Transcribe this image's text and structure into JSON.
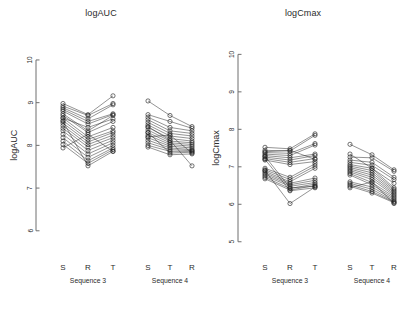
{
  "figure": {
    "width": 404,
    "height": 320,
    "background": "#ffffff",
    "ink": "#1f1f1f",
    "axis_color": "#6f6f6f"
  },
  "panels": [
    {
      "id": "logauc",
      "title": "logAUC",
      "ylabel": "logAUC"
    },
    {
      "id": "logcmax",
      "title": "logCmax",
      "ylabel": "logCmax"
    }
  ],
  "chart_data": [
    {
      "type": "line",
      "title": "logAUC",
      "xlabel": "",
      "ylabel": "logAUC",
      "ylim": [
        5.55,
        10.35
      ],
      "yticks": [
        6,
        7,
        8,
        9,
        10
      ],
      "ytick_labels": [
        "6",
        "7",
        "8",
        "9",
        "10"
      ],
      "grid": false,
      "legend": false,
      "groups": [
        {
          "name": "Sequence 3",
          "categories": [
            "S",
            "R",
            "T"
          ],
          "series": [
            {
              "name": "subject-1",
              "values": [
                8.98,
                8.72,
                9.16
              ]
            },
            {
              "name": "subject-2",
              "values": [
                8.92,
                8.7,
                8.98
              ]
            },
            {
              "name": "subject-3",
              "values": [
                8.88,
                8.62,
                8.95
              ]
            },
            {
              "name": "subject-4",
              "values": [
                8.84,
                8.56,
                8.74
              ]
            },
            {
              "name": "subject-5",
              "values": [
                8.8,
                8.5,
                8.72
              ]
            },
            {
              "name": "subject-6",
              "values": [
                8.74,
                8.34,
                8.7
              ]
            },
            {
              "name": "subject-7",
              "values": [
                8.7,
                8.3,
                8.56
              ]
            },
            {
              "name": "subject-8",
              "values": [
                8.64,
                8.2,
                8.42
              ]
            },
            {
              "name": "subject-9",
              "values": [
                8.58,
                8.14,
                8.34
              ]
            },
            {
              "name": "subject-10",
              "values": [
                8.52,
                8.08,
                8.3
              ]
            },
            {
              "name": "subject-11",
              "values": [
                8.46,
                8.02,
                8.24
              ]
            },
            {
              "name": "subject-12",
              "values": [
                8.4,
                7.96,
                8.18
              ]
            },
            {
              "name": "subject-13",
              "values": [
                8.34,
                7.88,
                8.12
              ]
            },
            {
              "name": "subject-14",
              "values": [
                8.26,
                7.8,
                8.06
              ]
            },
            {
              "name": "subject-15",
              "values": [
                8.18,
                7.72,
                8.0
              ]
            },
            {
              "name": "subject-16",
              "values": [
                8.1,
                7.64,
                7.94
              ]
            },
            {
              "name": "subject-17",
              "values": [
                8.02,
                7.58,
                7.9
              ]
            },
            {
              "name": "subject-18",
              "values": [
                7.94,
                8.26,
                7.86
              ]
            },
            {
              "name": "subject-19",
              "values": [
                8.64,
                8.42,
                8.62
              ]
            },
            {
              "name": "subject-20",
              "values": [
                8.56,
                7.52,
                7.86
              ]
            }
          ]
        },
        {
          "name": "Sequence 4",
          "categories": [
            "S",
            "T",
            "R"
          ],
          "series": [
            {
              "name": "subject-21",
              "values": [
                9.04,
                8.7,
                8.44
              ]
            },
            {
              "name": "subject-22",
              "values": [
                8.72,
                8.56,
                8.4
              ]
            },
            {
              "name": "subject-23",
              "values": [
                8.66,
                8.42,
                8.34
              ]
            },
            {
              "name": "subject-24",
              "values": [
                8.6,
                8.34,
                8.28
              ]
            },
            {
              "name": "subject-25",
              "values": [
                8.54,
                8.28,
                8.22
              ]
            },
            {
              "name": "subject-26",
              "values": [
                8.48,
                8.22,
                8.16
              ]
            },
            {
              "name": "subject-27",
              "values": [
                8.42,
                8.16,
                8.1
              ]
            },
            {
              "name": "subject-28",
              "values": [
                8.36,
                8.1,
                8.06
              ]
            },
            {
              "name": "subject-29",
              "values": [
                8.3,
                8.06,
                8.02
              ]
            },
            {
              "name": "subject-30",
              "values": [
                8.24,
                8.02,
                7.98
              ]
            },
            {
              "name": "subject-31",
              "values": [
                8.18,
                7.98,
                7.94
              ]
            },
            {
              "name": "subject-32",
              "values": [
                8.12,
                7.94,
                7.9
              ]
            },
            {
              "name": "subject-33",
              "values": [
                8.06,
                7.9,
                7.88
              ]
            },
            {
              "name": "subject-34",
              "values": [
                8.0,
                7.86,
                7.86
              ]
            },
            {
              "name": "subject-35",
              "values": [
                8.3,
                7.82,
                7.84
              ]
            },
            {
              "name": "subject-36",
              "values": [
                8.2,
                8.24,
                7.82
              ]
            },
            {
              "name": "subject-37",
              "values": [
                7.96,
                7.78,
                7.8
              ]
            },
            {
              "name": "subject-38",
              "values": [
                8.44,
                8.12,
                7.52
              ]
            }
          ]
        }
      ]
    },
    {
      "type": "line",
      "title": "logCmax",
      "xlabel": "",
      "ylabel": "logCmax",
      "ylim": [
        4.78,
        10.25
      ],
      "yticks": [
        5,
        6,
        7,
        8,
        9,
        10
      ],
      "ytick_labels": [
        "5",
        "6",
        "7",
        "8",
        "9",
        "10"
      ],
      "grid": false,
      "legend": false,
      "groups": [
        {
          "name": "Sequence 3",
          "categories": [
            "S",
            "R",
            "T"
          ],
          "series": [
            {
              "name": "subject-1",
              "values": [
                7.52,
                7.48,
                7.88
              ]
            },
            {
              "name": "subject-2",
              "values": [
                7.44,
                7.42,
                7.84
              ]
            },
            {
              "name": "subject-3",
              "values": [
                7.38,
                7.36,
                7.62
              ]
            },
            {
              "name": "subject-4",
              "values": [
                7.34,
                7.3,
                7.58
              ]
            },
            {
              "name": "subject-5",
              "values": [
                7.3,
                7.24,
                7.34
              ]
            },
            {
              "name": "subject-6",
              "values": [
                7.26,
                7.18,
                7.3
              ]
            },
            {
              "name": "subject-7",
              "values": [
                7.22,
                7.12,
                7.22
              ]
            },
            {
              "name": "subject-8",
              "values": [
                7.18,
                7.06,
                7.14
              ]
            },
            {
              "name": "subject-9",
              "values": [
                6.96,
                6.72,
                7.08
              ]
            },
            {
              "name": "subject-10",
              "values": [
                6.92,
                6.66,
                7.02
              ]
            },
            {
              "name": "subject-11",
              "values": [
                6.88,
                6.6,
                6.96
              ]
            },
            {
              "name": "subject-12",
              "values": [
                6.84,
                6.56,
                6.7
              ]
            },
            {
              "name": "subject-13",
              "values": [
                6.8,
                6.52,
                6.64
              ]
            },
            {
              "name": "subject-14",
              "values": [
                6.76,
                6.48,
                6.58
              ]
            },
            {
              "name": "subject-15",
              "values": [
                6.72,
                6.42,
                6.54
              ]
            },
            {
              "name": "subject-16",
              "values": [
                6.68,
                6.38,
                6.5
              ]
            },
            {
              "name": "subject-17",
              "values": [
                7.4,
                7.44,
                7.2
              ]
            },
            {
              "name": "subject-18",
              "values": [
                7.28,
                6.44,
                6.48
              ]
            },
            {
              "name": "subject-19",
              "values": [
                7.2,
                6.36,
                6.44
              ]
            },
            {
              "name": "subject-20",
              "values": [
                6.9,
                6.02,
                6.46
              ]
            }
          ]
        },
        {
          "name": "Sequence 4",
          "categories": [
            "S",
            "T",
            "R"
          ],
          "series": [
            {
              "name": "subject-21",
              "values": [
                7.6,
                7.32,
                6.92
              ]
            },
            {
              "name": "subject-22",
              "values": [
                7.26,
                7.24,
                6.88
              ]
            },
            {
              "name": "subject-23",
              "values": [
                7.18,
                7.12,
                6.72
              ]
            },
            {
              "name": "subject-24",
              "values": [
                7.12,
                7.04,
                6.66
              ]
            },
            {
              "name": "subject-25",
              "values": [
                7.06,
                6.96,
                6.44
              ]
            },
            {
              "name": "subject-26",
              "values": [
                7.02,
                6.9,
                6.4
              ]
            },
            {
              "name": "subject-27",
              "values": [
                6.98,
                6.84,
                6.36
              ]
            },
            {
              "name": "subject-28",
              "values": [
                6.94,
                6.78,
                6.32
              ]
            },
            {
              "name": "subject-29",
              "values": [
                6.9,
                6.72,
                6.28
              ]
            },
            {
              "name": "subject-30",
              "values": [
                6.86,
                6.66,
                6.24
              ]
            },
            {
              "name": "subject-31",
              "values": [
                6.82,
                6.58,
                6.2
              ]
            },
            {
              "name": "subject-32",
              "values": [
                6.78,
                6.52,
                6.16
              ]
            },
            {
              "name": "subject-33",
              "values": [
                6.6,
                6.46,
                6.12
              ]
            },
            {
              "name": "subject-34",
              "values": [
                6.56,
                6.4,
                6.08
              ]
            },
            {
              "name": "subject-35",
              "values": [
                6.52,
                6.34,
                6.06
              ]
            },
            {
              "name": "subject-36",
              "values": [
                7.34,
                6.96,
                6.56
              ]
            },
            {
              "name": "subject-37",
              "values": [
                6.48,
                6.3,
                6.04
              ]
            },
            {
              "name": "subject-38",
              "values": [
                6.44,
                6.6,
                6.02
              ]
            }
          ]
        }
      ]
    }
  ]
}
